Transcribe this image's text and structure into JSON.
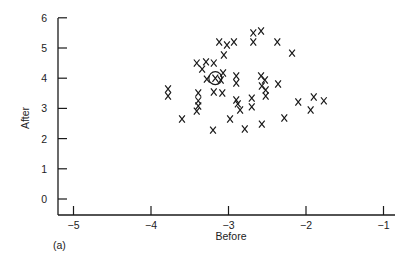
{
  "chart_data": {
    "type": "scatter",
    "title": "",
    "panel_label": "(a)",
    "xlabel": "Before",
    "ylabel": "After",
    "xlim": [
      -5,
      -1
    ],
    "ylim": [
      0,
      6
    ],
    "xticks": [
      -5,
      -4,
      -3,
      -2,
      -1
    ],
    "xtick_labels": [
      "−5",
      "−4",
      "−3",
      "−2",
      "−1"
    ],
    "yticks": [
      0,
      1,
      2,
      3,
      4,
      5,
      6
    ],
    "ytick_labels": [
      "0",
      "1",
      "2",
      "3",
      "4",
      "5",
      "6"
    ],
    "grid": false,
    "marker": "x",
    "highlighted_point": {
      "x": -3.17,
      "y": 4.0,
      "style": "circled"
    },
    "points": [
      {
        "x": -3.12,
        "y": 5.2
      },
      {
        "x": -3.02,
        "y": 5.1
      },
      {
        "x": -2.93,
        "y": 5.2
      },
      {
        "x": -2.68,
        "y": 5.5
      },
      {
        "x": -2.58,
        "y": 5.56
      },
      {
        "x": -2.68,
        "y": 5.2
      },
      {
        "x": -2.37,
        "y": 5.2
      },
      {
        "x": -2.18,
        "y": 4.83
      },
      {
        "x": -3.06,
        "y": 4.77
      },
      {
        "x": -3.41,
        "y": 4.5
      },
      {
        "x": -3.34,
        "y": 4.3
      },
      {
        "x": -3.29,
        "y": 4.54
      },
      {
        "x": -3.19,
        "y": 4.5
      },
      {
        "x": -3.07,
        "y": 4.17
      },
      {
        "x": -3.28,
        "y": 3.97
      },
      {
        "x": -3.17,
        "y": 4.0
      },
      {
        "x": -3.1,
        "y": 3.94
      },
      {
        "x": -3.78,
        "y": 3.64
      },
      {
        "x": -3.78,
        "y": 3.41
      },
      {
        "x": -3.39,
        "y": 3.51
      },
      {
        "x": -3.39,
        "y": 3.25
      },
      {
        "x": -3.39,
        "y": 3.08
      },
      {
        "x": -3.41,
        "y": 2.91
      },
      {
        "x": -3.6,
        "y": 2.65
      },
      {
        "x": -3.19,
        "y": 3.54
      },
      {
        "x": -3.08,
        "y": 3.51
      },
      {
        "x": -2.9,
        "y": 4.07
      },
      {
        "x": -2.9,
        "y": 3.84
      },
      {
        "x": -2.9,
        "y": 3.28
      },
      {
        "x": -2.88,
        "y": 3.15
      },
      {
        "x": -2.85,
        "y": 2.95
      },
      {
        "x": -2.98,
        "y": 2.65
      },
      {
        "x": -3.2,
        "y": 2.28
      },
      {
        "x": -2.79,
        "y": 2.32
      },
      {
        "x": -2.7,
        "y": 3.34
      },
      {
        "x": -2.7,
        "y": 3.05
      },
      {
        "x": -2.58,
        "y": 4.07
      },
      {
        "x": -2.53,
        "y": 3.94
      },
      {
        "x": -2.57,
        "y": 3.74
      },
      {
        "x": -2.52,
        "y": 3.61
      },
      {
        "x": -2.52,
        "y": 3.41
      },
      {
        "x": -2.57,
        "y": 2.48
      },
      {
        "x": -2.36,
        "y": 3.81
      },
      {
        "x": -2.28,
        "y": 2.68
      },
      {
        "x": -2.1,
        "y": 3.21
      },
      {
        "x": -1.9,
        "y": 3.38
      },
      {
        "x": -1.77,
        "y": 3.25
      },
      {
        "x": -1.94,
        "y": 2.95
      }
    ]
  }
}
